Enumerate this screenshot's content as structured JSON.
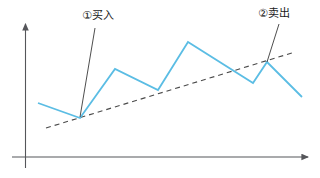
{
  "chart_data": {
    "type": "line",
    "title": "",
    "xlabel": "",
    "ylabel": "",
    "grid": false,
    "legend_position": "none",
    "axes": {
      "x_axis_arrow": true,
      "y_axis_arrow": true,
      "axis_color": "#55565a",
      "x_range_px": [
        12,
        310
      ],
      "y_range_px": [
        22,
        157
      ]
    },
    "series": [
      {
        "name": "price",
        "color": "#5bbde4",
        "style": "solid",
        "points": [
          {
            "x": 38,
            "y": 103
          },
          {
            "x": 80,
            "y": 118
          },
          {
            "x": 115,
            "y": 69
          },
          {
            "x": 158,
            "y": 90
          },
          {
            "x": 188,
            "y": 42
          },
          {
            "x": 253,
            "y": 83
          },
          {
            "x": 267,
            "y": 62
          },
          {
            "x": 302,
            "y": 97
          }
        ]
      },
      {
        "name": "trendline",
        "color": "#4a4a4a",
        "style": "dashed",
        "points": [
          {
            "x": 46,
            "y": 128
          },
          {
            "x": 295,
            "y": 52
          }
        ]
      }
    ],
    "annotations": [
      {
        "id": "buy",
        "label": "①买入",
        "marker": "①",
        "text": "买入",
        "leader_from": {
          "x": 95,
          "y": 28
        },
        "leader_to": {
          "x": 80,
          "y": 117
        },
        "target_point": {
          "x": 80,
          "y": 118
        },
        "leader_color": "#3a3a3a"
      },
      {
        "id": "sell",
        "label": "②卖出",
        "marker": "②",
        "text": "卖出",
        "leader_from": {
          "x": 279,
          "y": 24
        },
        "leader_to": {
          "x": 267,
          "y": 62
        },
        "target_point": {
          "x": 267,
          "y": 62
        },
        "leader_color": "#3a3a3a"
      }
    ]
  },
  "annotations": {
    "buy_label": "①买入",
    "sell_label": "②卖出"
  },
  "colors": {
    "line": "#5bbde4",
    "trendline": "#4a4a4a",
    "axis": "#55565a",
    "background": "#ffffff",
    "text": "#1a1a1a"
  }
}
